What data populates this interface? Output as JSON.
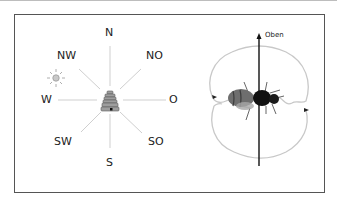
{
  "figure": {
    "compass": {
      "labels": {
        "N": "N",
        "NO": "NO",
        "O": "O",
        "SO": "SO",
        "S": "S",
        "SW": "SW",
        "W": "W",
        "NW": "NW"
      },
      "sun_icon": "sun-icon",
      "hive_icon": "beehive-icon"
    },
    "dance": {
      "up_label": "Oben",
      "bee_icon": "bee-icon"
    },
    "colors": {
      "compass_lines": "#cfcfcf",
      "dance_path": "#c8c8c8",
      "axis": "#111111",
      "frame": "#555555"
    }
  }
}
